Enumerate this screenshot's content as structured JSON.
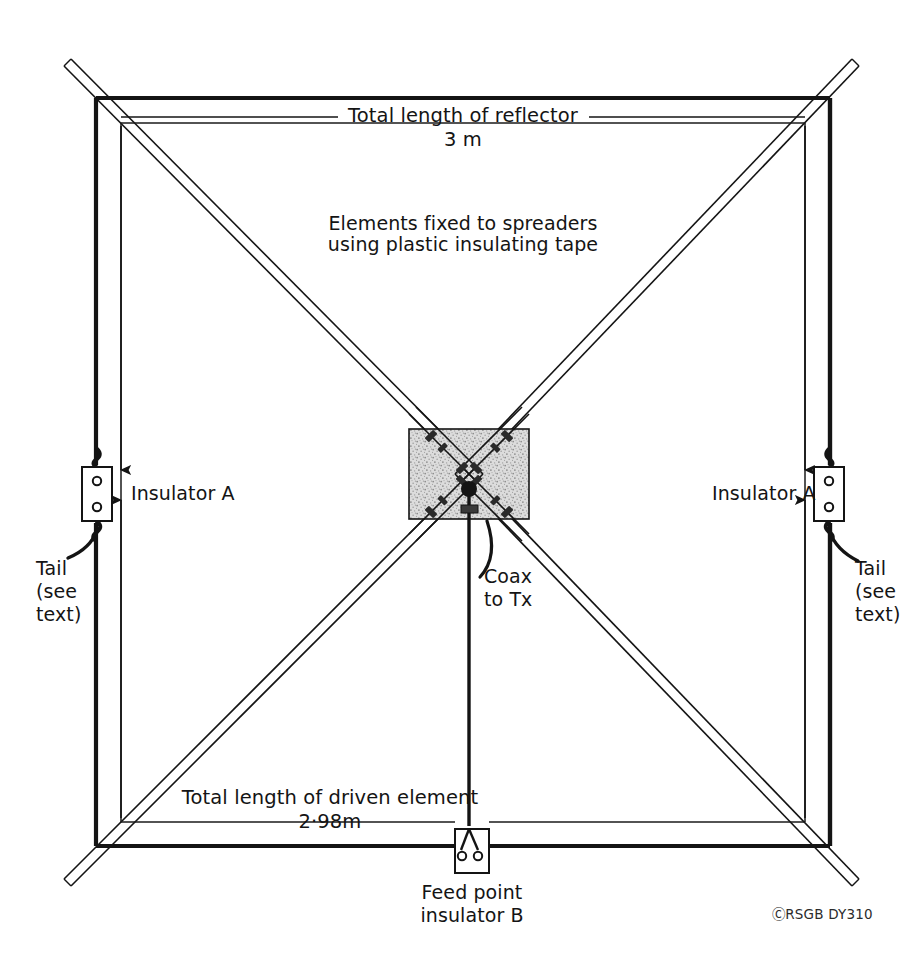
{
  "figure": {
    "type": "technical-diagram",
    "background_color": "#ffffff",
    "ink_color": "#141414"
  },
  "labels": {
    "reflector_title": "Total length of reflector",
    "reflector_value": "3 m",
    "spreader_note_line1": "Elements fixed to spreaders",
    "spreader_note_line2": "using plastic insulating tape",
    "insulator_left": "Insulator A",
    "insulator_right": "Insulator A",
    "tail_left_line1": "Tail",
    "tail_left_line2": "(see",
    "tail_left_line3": "text)",
    "tail_right_line1": "Tail",
    "tail_right_line2": "(see",
    "tail_right_line3": "text)",
    "coax_line1": "Coax",
    "coax_line2": "to Tx",
    "driven_title": "Total length of driven element",
    "driven_value": "2·98m",
    "feed_point_line1": "Feed point",
    "feed_point_line2": "insulator B",
    "copyright": "ⒸRSGB DY310"
  },
  "geometry": {
    "reflector_square": {
      "left": 96,
      "top": 98,
      "right": 830,
      "bottom": 846
    },
    "driven_square": {
      "left": 121,
      "top": 123,
      "right": 805,
      "bottom": 822
    },
    "hub_square": {
      "left": 409,
      "top": 429,
      "right": 529,
      "bottom": 519
    },
    "hub_fill": "#d9d9d9",
    "spreader_overshoot_px": 46,
    "insulator_left_box": {
      "x": 82,
      "y": 467,
      "w": 30,
      "h": 54
    },
    "insulator_right_box": {
      "x": 814,
      "y": 467,
      "w": 30,
      "h": 54
    },
    "feed_insulator_box": {
      "x": 455,
      "y": 829,
      "w": 34,
      "h": 44
    }
  },
  "colors": {
    "ink": "#141414",
    "hub_stipple_light": "#dedede",
    "hub_stipple_dark": "#8d8d8d",
    "thin_line": "#1a1a1a"
  }
}
